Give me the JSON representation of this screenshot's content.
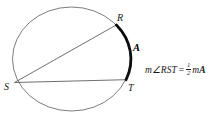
{
  "diagram": {
    "labels": {
      "R": "R",
      "S": "S",
      "T": "T",
      "arc": "A"
    },
    "formula": {
      "lhs": "m∠RST",
      "eq": "=",
      "numerator": "1",
      "denominator": "2",
      "rhs_m": "m",
      "rhs_A": "A"
    },
    "colors": {
      "circle": "#6e6e6e",
      "chord": "#4a4a4a",
      "arc": "#0d0d0d",
      "text": "#1a1a1a",
      "background": "#ffffff"
    }
  }
}
